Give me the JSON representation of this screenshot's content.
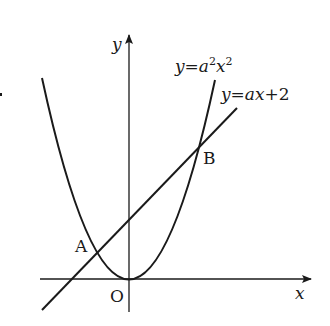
{
  "diagram": {
    "type": "coordinate-plane",
    "axes": {
      "x_label": "x",
      "y_label": "y",
      "origin_label": "O"
    },
    "curves": [
      {
        "name": "parabola",
        "equation": "y=a²x²",
        "label_parts": {
          "y": "y",
          "eq": "=",
          "a": "a",
          "sup1": "2",
          "x": "x",
          "sup2": "2"
        }
      },
      {
        "name": "line",
        "equation": "y=ax+2",
        "label_parts": {
          "y": "y",
          "eq": "=",
          "a": "a",
          "x": "x",
          "rest": "+2"
        }
      }
    ],
    "points": [
      {
        "name": "A",
        "label": "A"
      },
      {
        "name": "B",
        "label": "B"
      }
    ],
    "colors": {
      "stroke": "#1a1a1a",
      "background": "#ffffff"
    }
  }
}
